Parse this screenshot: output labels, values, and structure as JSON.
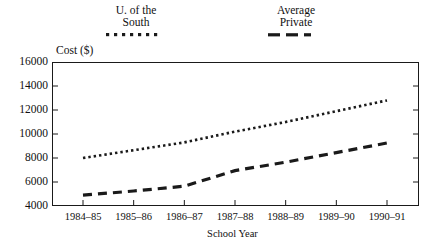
{
  "chart_data": {
    "type": "line",
    "title": "",
    "xlabel": "School Year",
    "ylabel": "Cost ($)",
    "categories": [
      "1984–85",
      "1985–86",
      "1986–87",
      "1987–88",
      "1988–89",
      "1989–90",
      "1990–91"
    ],
    "ylim": [
      4000,
      16000
    ],
    "yticks": [
      4000,
      6000,
      8000,
      10000,
      12000,
      14000,
      16000
    ],
    "ytick_labels": [
      "4000",
      "6000",
      "8000",
      "10000",
      "12000",
      "14000",
      "16000"
    ],
    "grid": false,
    "legend_position": "above-plot",
    "series": [
      {
        "name": "U. of the South",
        "name_line1": "U. of the",
        "name_line2": "South",
        "linestyle": "dotted",
        "color": "#1a1a1a",
        "values": [
          8000,
          8650,
          9300,
          10200,
          11000,
          11900,
          12800
        ]
      },
      {
        "name": "Average Private",
        "name_line1": "Average",
        "name_line2": "Private",
        "linestyle": "dashed",
        "color": "#1a1a1a",
        "values": [
          4900,
          5250,
          5650,
          6950,
          7650,
          8450,
          9250
        ]
      }
    ]
  },
  "axes": {
    "y_axis_title": "Cost ($)",
    "x_axis_title": "School Year"
  }
}
